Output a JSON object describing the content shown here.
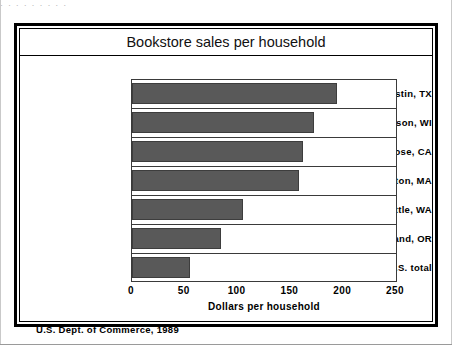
{
  "figure": {
    "title": "Bookstore sales per household",
    "source_note": "U.S. Dept. of Commerce, 1989",
    "scan_artifact_text": "·  ·   ·        ·      ·    ·   · ·     ·"
  },
  "chart_data": {
    "type": "bar",
    "orientation": "horizontal",
    "title": "Bookstore sales per household",
    "xlabel": "Dollars per household",
    "ylabel": "",
    "xlim": [
      0,
      250
    ],
    "xticks": [
      0,
      50,
      100,
      150,
      200,
      250
    ],
    "xtick_labels": [
      "0",
      "50",
      "100",
      "150",
      "200",
      "250"
    ],
    "grid": false,
    "legend": false,
    "bar_color": "#595959",
    "categories": [
      "Austin, TX",
      "Madison, WI",
      "San Jose, CA",
      "Boston, MA",
      "Seattle, WA",
      "Portland, OR",
      "U.S. total"
    ],
    "values": [
      194,
      172,
      162,
      158,
      105,
      84,
      55
    ],
    "source": "U.S. Dept. of Commerce, 1989"
  }
}
